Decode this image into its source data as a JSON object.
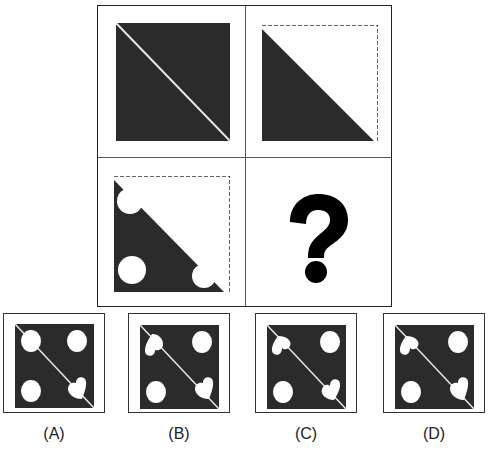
{
  "puzzle": {
    "colors": {
      "dark": "#2b2b2b",
      "light": "#ffffff",
      "line": "#dddddd"
    },
    "grid": {
      "cells": [
        {
          "position": "top-left",
          "description": "dark square with white diagonal line"
        },
        {
          "position": "top-right",
          "description": "lower-left dark triangle, dashed upper-right outline"
        },
        {
          "position": "bottom-left",
          "description": "lower-left dark triangle with circle and notches, dashed outline"
        },
        {
          "position": "bottom-right",
          "description": "question mark",
          "symbol": "?"
        }
      ]
    },
    "options": [
      {
        "label": "(A)",
        "shapes": [
          "circle-top-left",
          "circle-top-right",
          "circle-bottom-left",
          "heart-bottom-right"
        ]
      },
      {
        "label": "(B)",
        "shapes": [
          "heart-top-left",
          "circle-top-right",
          "circle-bottom-left",
          "heart-bottom-right"
        ]
      },
      {
        "label": "(C)",
        "shapes": [
          "heart-top-left",
          "circle-top-right",
          "circle-bottom-left",
          "heart-bottom-right"
        ]
      },
      {
        "label": "(D)",
        "shapes": [
          "heart-top-left",
          "circle-top-right",
          "circle-bottom-left",
          "heart-bottom-right"
        ]
      }
    ],
    "question_mark": "?"
  }
}
